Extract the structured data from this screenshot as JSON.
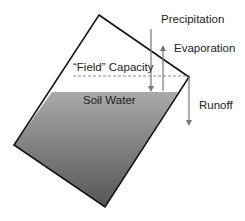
{
  "diagram": {
    "labels": {
      "precipitation": "Precipitation",
      "evaporation": "Evaporation",
      "field_capacity": "“Field” Capacity",
      "soil_water": "Soil Water",
      "runoff": "Runoff"
    },
    "colors": {
      "outline": "#111111",
      "soil_top": "#a8a8a8",
      "soil_bottom": "#5a5a5a",
      "arrow": "#777777",
      "dashed": "#888888"
    }
  }
}
